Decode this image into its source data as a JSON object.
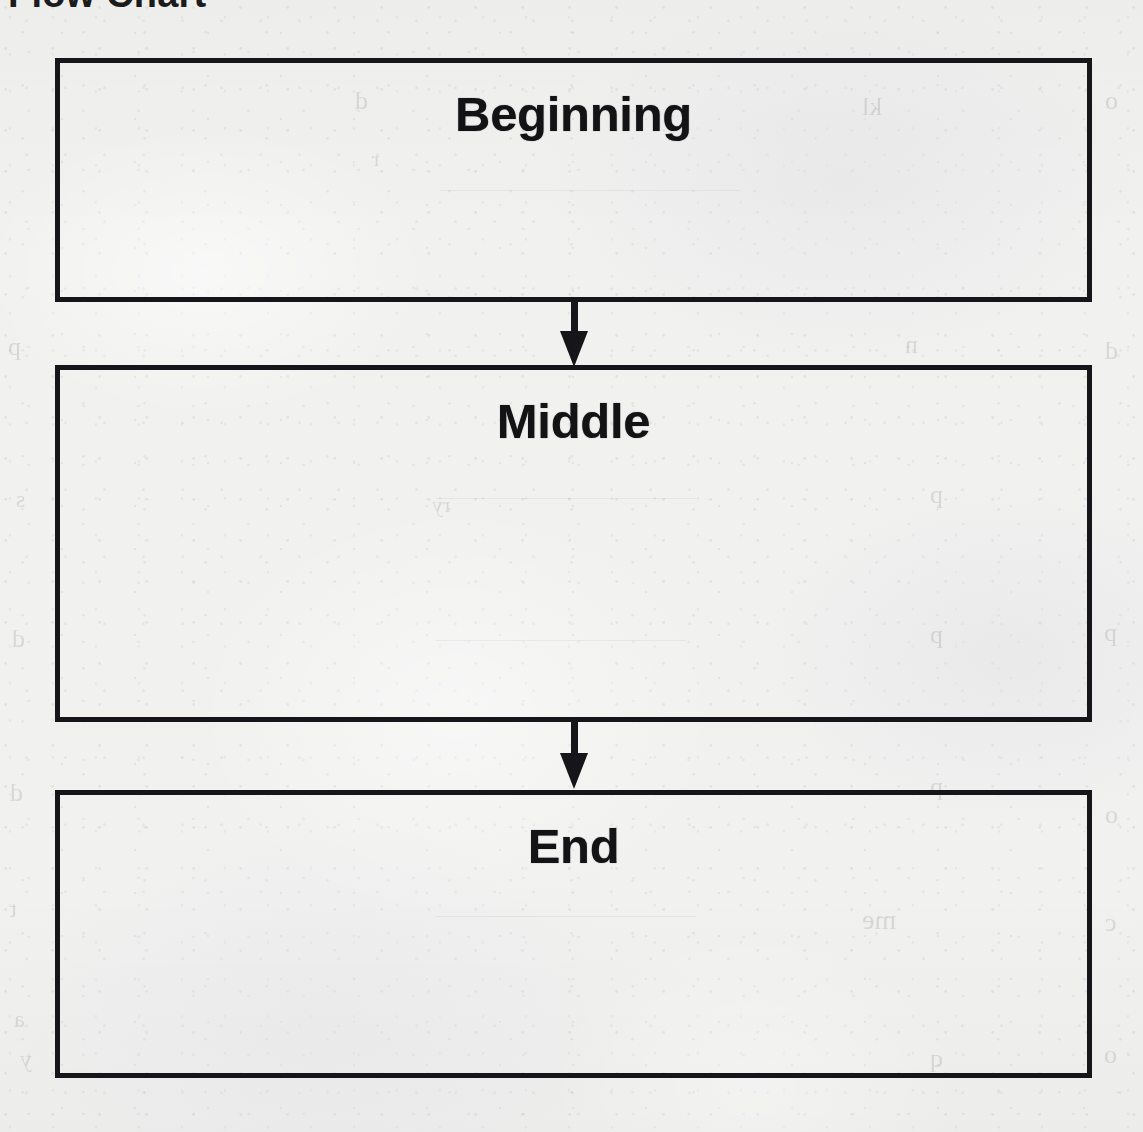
{
  "document": {
    "title": "Flow Chart",
    "title_note": "cropped at top edge of page",
    "background_color": "#f1f1f0",
    "ink_color": "#16161a",
    "page_width": 1143,
    "page_height": 1132
  },
  "flowchart": {
    "orientation": "vertical",
    "border_width_px": 5,
    "boxes": [
      {
        "id": "beginning",
        "label": "Beginning",
        "x": 55,
        "y": 58,
        "width": 1037,
        "height": 244,
        "content": ""
      },
      {
        "id": "middle",
        "label": "Middle",
        "x": 55,
        "y": 365,
        "width": 1037,
        "height": 357,
        "content": ""
      },
      {
        "id": "end",
        "label": "End",
        "x": 55,
        "y": 790,
        "width": 1037,
        "height": 288,
        "content": ""
      }
    ],
    "arrows": [
      {
        "id": "arrow-beginning-to-middle",
        "from": "beginning",
        "to": "middle",
        "direction": "down",
        "center_x": 574
      },
      {
        "id": "arrow-middle-to-end",
        "from": "middle",
        "to": "end",
        "direction": "down",
        "center_x": 574
      }
    ]
  },
  "bleed_through": {
    "description": "faint mirrored handwriting/print showing through from the reverse side of the scanned sheet",
    "marks": [
      {
        "text": "d",
        "left": 355,
        "top": 86,
        "size": 26
      },
      {
        "text": "kl",
        "left": 862,
        "top": 92,
        "size": 26
      },
      {
        "text": "o",
        "left": 1105,
        "top": 86,
        "size": 26
      },
      {
        "text": "r",
        "left": 372,
        "top": 146,
        "size": 22
      },
      {
        "text": "n",
        "left": 905,
        "top": 330,
        "size": 26
      },
      {
        "text": "p",
        "left": 8,
        "top": 332,
        "size": 26
      },
      {
        "text": "d",
        "left": 1105,
        "top": 336,
        "size": 26
      },
      {
        "text": "p",
        "left": 930,
        "top": 480,
        "size": 26
      },
      {
        "text": "s",
        "left": 16,
        "top": 486,
        "size": 24
      },
      {
        "text": "ry",
        "left": 432,
        "top": 492,
        "size": 22
      },
      {
        "text": "p",
        "left": 930,
        "top": 620,
        "size": 26
      },
      {
        "text": "d",
        "left": 12,
        "top": 624,
        "size": 26
      },
      {
        "text": "p",
        "left": 1104,
        "top": 618,
        "size": 26
      },
      {
        "text": "p",
        "left": 930,
        "top": 772,
        "size": 26
      },
      {
        "text": "d",
        "left": 10,
        "top": 778,
        "size": 26
      },
      {
        "text": "o",
        "left": 1105,
        "top": 800,
        "size": 26
      },
      {
        "text": "me",
        "left": 862,
        "top": 904,
        "size": 28
      },
      {
        "text": "t",
        "left": 10,
        "top": 896,
        "size": 24
      },
      {
        "text": "c",
        "left": 1105,
        "top": 908,
        "size": 26
      },
      {
        "text": "a",
        "left": 14,
        "top": 1006,
        "size": 24
      },
      {
        "text": "q",
        "left": 930,
        "top": 1044,
        "size": 26
      },
      {
        "text": "o",
        "left": 1104,
        "top": 1040,
        "size": 26
      },
      {
        "text": "y",
        "left": 20,
        "top": 1046,
        "size": 24
      }
    ],
    "rules": [
      {
        "left": 436,
        "top": 498,
        "width": 260
      },
      {
        "left": 436,
        "top": 640,
        "width": 250
      },
      {
        "left": 436,
        "top": 916,
        "width": 260
      },
      {
        "left": 440,
        "top": 190,
        "width": 300
      }
    ]
  }
}
